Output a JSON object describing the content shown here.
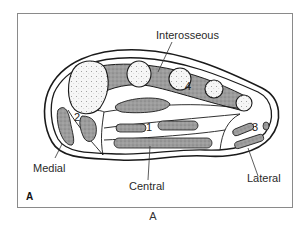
{
  "figure": {
    "panel_label": "A",
    "caption": "A",
    "compartment_labels": {
      "interosseous": "Interosseous",
      "medial": "Medial",
      "central": "Central",
      "lateral": "Lateral"
    },
    "compartment_numbers": {
      "central": "1",
      "medial": "2",
      "lateral": "3",
      "interosseous": "4"
    },
    "colors": {
      "outline": "#1a1a1a",
      "muscle_fill": "#9a9a9a",
      "bone_fill": "#f4f4f4",
      "frame": "#8a8a8a"
    }
  }
}
